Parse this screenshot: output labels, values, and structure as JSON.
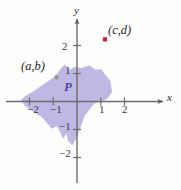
{
  "figure": {
    "width": 181,
    "height": 190,
    "background_color": "#fdfdfb",
    "region_label": "P",
    "axis_labels": {
      "x": "x",
      "y": "y"
    },
    "colors": {
      "region_fill": "#b6aee0",
      "region_stroke": "#b6aee0",
      "axis": "#6b6b6b",
      "tick_text": "#3a3a3a",
      "point_cd": "#cc2233",
      "point_ab": "#8d9b86",
      "region_label": "#4a47a8"
    }
  },
  "chart_data": {
    "type": "scatter",
    "title": "",
    "xlabel": "x",
    "ylabel": "y",
    "xlim": [
      -2.65,
      2.55
    ],
    "ylim": [
      -2.45,
      2.75
    ],
    "grid": false,
    "legend": "none",
    "xticks": [
      -2,
      -1,
      1,
      2
    ],
    "xtick_labels": [
      "−2",
      "−1",
      "1",
      "2"
    ],
    "yticks": [
      2,
      1,
      -1,
      -2
    ],
    "ytick_labels": [
      "2",
      "1",
      "−1",
      "−2"
    ],
    "points": [
      {
        "name": "point-ab",
        "label": "(a,b)",
        "x": -0.86,
        "y": 0.86,
        "color": "#8d9b86",
        "label_position": "upper-left"
      },
      {
        "name": "point-cd",
        "label": "(c,d)",
        "x": 1.18,
        "y": 2.22,
        "color": "#cc2233",
        "label_position": "upper-right"
      }
    ],
    "regions": [
      {
        "name": "region-P",
        "label": "P",
        "label_x": -0.42,
        "label_y": 0.55,
        "fill": "#b6aee0",
        "opacity": 0.85,
        "vertices": [
          [
            -0.52,
            1.3
          ],
          [
            -0.3,
            1.12
          ],
          [
            -0.12,
            1.22
          ],
          [
            0.2,
            1.18
          ],
          [
            0.52,
            1.28
          ],
          [
            0.78,
            1.12
          ],
          [
            1.02,
            1.14
          ],
          [
            1.18,
            0.95
          ],
          [
            1.4,
            0.72
          ],
          [
            1.46,
            0.34
          ],
          [
            1.28,
            0.12
          ],
          [
            1.04,
            0.02
          ],
          [
            0.72,
            -0.06
          ],
          [
            0.5,
            -0.3
          ],
          [
            0.3,
            -0.52
          ],
          [
            0.18,
            -0.82
          ],
          [
            0.06,
            -1.08
          ],
          [
            -0.06,
            -1.34
          ],
          [
            -0.2,
            -1.55
          ],
          [
            -0.36,
            -1.4
          ],
          [
            -0.44,
            -1.12
          ],
          [
            -0.58,
            -1.3
          ],
          [
            -0.7,
            -1.08
          ],
          [
            -0.86,
            -0.86
          ],
          [
            -1.06,
            -0.96
          ],
          [
            -1.24,
            -0.78
          ],
          [
            -1.46,
            -0.56
          ],
          [
            -1.72,
            -0.42
          ],
          [
            -1.98,
            -0.28
          ],
          [
            -2.22,
            -0.12
          ],
          [
            -2.34,
            0.06
          ],
          [
            -2.14,
            0.2
          ],
          [
            -1.86,
            0.34
          ],
          [
            -1.58,
            0.5
          ],
          [
            -1.3,
            0.66
          ],
          [
            -1.04,
            0.82
          ],
          [
            -0.82,
            1.0
          ],
          [
            -0.66,
            1.18
          ]
        ]
      }
    ]
  }
}
